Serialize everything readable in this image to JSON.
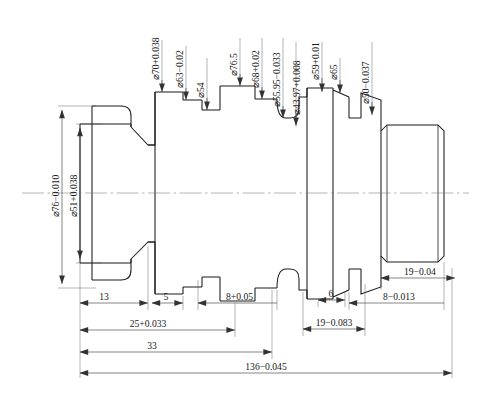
{
  "drawing": {
    "title": "Stepped shaft part drawing",
    "type": "mechanical-engineering-drawing",
    "view": "front-sectional-outline",
    "line_color": "#1a1a1a",
    "background": "#ffffff"
  },
  "diameter_dimensions_top": [
    {
      "id": "d70",
      "label": "⌀70+0.038",
      "x": 162,
      "leader_y_top": 40,
      "leader_y_bot": 92
    },
    {
      "id": "d63",
      "label": "⌀63−0.02",
      "x": 186,
      "leader_y_top": 40,
      "leader_y_bot": 100
    },
    {
      "id": "d54",
      "label": "⌀54",
      "x": 207,
      "leader_y_top": 56,
      "leader_y_bot": 110
    },
    {
      "id": "d76_5",
      "label": "⌀76.5",
      "x": 240,
      "leader_y_top": 38,
      "leader_y_bot": 86
    },
    {
      "id": "d68",
      "label": "⌀68+0.02",
      "x": 262,
      "leader_y_top": 38,
      "leader_y_bot": 99
    },
    {
      "id": "d55_95",
      "label": "⌀55.95−0.033",
      "x": 283,
      "leader_y_top": 38,
      "leader_y_bot": 118
    },
    {
      "id": "d43_97",
      "label": "⌀43.97+0.008",
      "x": 302,
      "leader_y_top": 42,
      "leader_y_bot": 126
    },
    {
      "id": "d59",
      "label": "⌀59+0.01",
      "x": 322,
      "leader_y_top": 42,
      "leader_y_bot": 104
    },
    {
      "id": "d65",
      "label": "⌀65",
      "x": 340,
      "leader_y_top": 56,
      "leader_y_bot": 101
    },
    {
      "id": "d50",
      "label": "⌀50−0.037",
      "x": 372,
      "leader_y_top": 42,
      "leader_y_bot": 115
    }
  ],
  "diameter_dimensions_left": [
    {
      "id": "d76",
      "label": "⌀76−0.010",
      "x": 62,
      "y_top": 106,
      "y_bot": 288
    },
    {
      "id": "d51",
      "label": "⌀51+0.038",
      "x": 80,
      "y_top": 124,
      "y_bot": 270
    }
  ],
  "length_dimensions_bottom": [
    {
      "id": "len13",
      "label": "13",
      "x1": 80,
      "x2": 148,
      "y": 303
    },
    {
      "id": "len5",
      "label": "5",
      "x1": 148,
      "x2": 183,
      "y": 303
    },
    {
      "id": "len8p",
      "label": "8+0.05",
      "x1": 198,
      "x2": 277,
      "y": 303
    },
    {
      "id": "len25",
      "label": "25+0.033",
      "x1": 80,
      "x2": 235,
      "y": 330
    },
    {
      "id": "len33",
      "label": "33",
      "x1": 80,
      "x2": 272,
      "y": 352
    },
    {
      "id": "len6",
      "label": "6",
      "x1": 318,
      "x2": 345,
      "y": 300
    },
    {
      "id": "len19a",
      "label": "19−0.083",
      "x1": 303,
      "x2": 365,
      "y": 329
    },
    {
      "id": "len19b",
      "label": "19−0.04",
      "x1": 381,
      "x2": 455,
      "y": 278
    },
    {
      "id": "len8m",
      "label": "8−0.013",
      "x1": 349,
      "x2": 444,
      "y": 303
    },
    {
      "id": "len136",
      "label": "136−0.045",
      "x1": 80,
      "x2": 452,
      "y": 373
    }
  ],
  "centerline": {
    "y": 193,
    "x1": 22,
    "x2": 469
  },
  "profile": {
    "note": "stepped shaft outline, mirrored about centerline",
    "half_sections": [
      {
        "name": "left-flange-outer",
        "x1": 92,
        "x2": 131,
        "r": 87
      },
      {
        "name": "left-journal",
        "x1": 80,
        "x2": 131,
        "r": 68
      },
      {
        "name": "taper-neck",
        "x1": 131,
        "x2": 148,
        "r": 87
      },
      {
        "name": "neck",
        "x1": 148,
        "x2": 155,
        "r": 56
      },
      {
        "name": "step-70",
        "x1": 155,
        "x2": 183,
        "r": 62
      },
      {
        "name": "step-63",
        "x1": 183,
        "x2": 202,
        "r": 55
      },
      {
        "name": "step-54",
        "x1": 202,
        "x2": 220,
        "r": 47
      },
      {
        "name": "big-collar-76_5",
        "x1": 220,
        "x2": 255,
        "r": 75
      },
      {
        "name": "step-68",
        "x1": 255,
        "x2": 277,
        "r": 55
      },
      {
        "name": "relief-groove",
        "x1": 277,
        "x2": 290,
        "r": 36
      },
      {
        "name": "step-43_97",
        "x1": 290,
        "x2": 307,
        "r": 50
      },
      {
        "name": "step-59",
        "x1": 307,
        "x2": 333,
        "r": 62
      },
      {
        "name": "step-65",
        "x1": 333,
        "x2": 349,
        "r": 58
      },
      {
        "name": "step-50",
        "x1": 361,
        "x2": 381,
        "r": 62
      },
      {
        "name": "end-shaft",
        "x1": 381,
        "x2": 444,
        "r": 42
      }
    ]
  }
}
